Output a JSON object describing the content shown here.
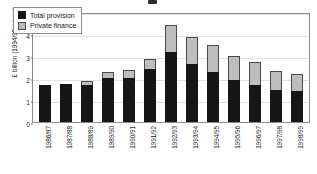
{
  "chart_data": {
    "type": "bar",
    "stacked": true,
    "title": "",
    "xlabel": "",
    "ylabel": "£ billion (1994/95 prices)",
    "ylim": [
      0,
      5
    ],
    "yticks": [
      0,
      1,
      2,
      3,
      4,
      5
    ],
    "grid": true,
    "legend_position": "top-left",
    "categories": [
      "1986/87",
      "1987/88",
      "1988/89",
      "1989/90",
      "1990/91",
      "1991/92",
      "1992/93",
      "1993/94",
      "1994/95",
      "1995/96",
      "1996/97",
      "1997/98",
      "1998/99"
    ],
    "series": [
      {
        "name": "Total provision",
        "color": "#161616",
        "values": [
          1.7,
          1.75,
          1.68,
          2.0,
          2.02,
          2.42,
          3.2,
          2.62,
          2.28,
          1.9,
          1.7,
          1.45,
          1.4
        ]
      },
      {
        "name": "Private finance",
        "color": "#bdbdbd",
        "values": [
          0.0,
          0.0,
          0.17,
          0.28,
          0.33,
          0.46,
          1.2,
          1.26,
          1.2,
          1.12,
          1.05,
          0.85,
          0.78
        ]
      }
    ],
    "totals": [
      1.7,
      1.75,
      1.85,
      2.28,
      2.35,
      2.88,
      4.4,
      3.88,
      3.48,
      3.02,
      2.75,
      2.3,
      2.18
    ]
  },
  "legend": {
    "items": [
      {
        "label": "Total provision"
      },
      {
        "label": "Private finance"
      }
    ]
  },
  "axis": {
    "y_title": "£ billion (1994/95 prices)",
    "y_ticks": [
      "0",
      "1",
      "2",
      "3",
      "4",
      "5"
    ]
  }
}
